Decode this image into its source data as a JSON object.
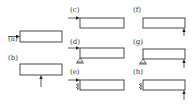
{
  "figure": {
    "panels": [
      {
        "id": "a",
        "label": "(a)",
        "load": "axial-left-end",
        "support": "none"
      },
      {
        "id": "b",
        "label": "(b)",
        "load": "vertical-upward-midspan",
        "support": "none"
      },
      {
        "id": "c",
        "label": "(c)",
        "load": "axial-left-end",
        "support": "none"
      },
      {
        "id": "d",
        "label": "(d)",
        "load": "axial-left-end",
        "support": "pin-left"
      },
      {
        "id": "e",
        "label": "(e)",
        "load": "axial-left-end",
        "support": "clamp-left"
      },
      {
        "id": "f",
        "label": "(f)",
        "load": "vertical-upward-right-end",
        "support": "none"
      },
      {
        "id": "g",
        "label": "(g)",
        "load": "vertical-upward-right-end",
        "support": "pin-left"
      },
      {
        "id": "h",
        "label": "(h)",
        "load": "vertical-upward-right-end",
        "support": "clamp-left"
      }
    ]
  }
}
